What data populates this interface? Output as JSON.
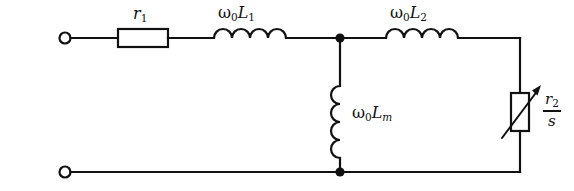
{
  "diagram": {
    "type": "electrical-schematic",
    "colors": {
      "wire": "#111111",
      "background": "#ffffff",
      "component_fill": "#ffffff"
    }
  },
  "labels": {
    "r1": {
      "symbol": "r",
      "subscript": "1"
    },
    "wL1": {
      "omega": "ω",
      "omega_sub": "0",
      "symbol": "L",
      "subscript": "1"
    },
    "wL2": {
      "omega": "ω",
      "omega_sub": "0",
      "symbol": "L",
      "subscript": "2"
    },
    "wLm": {
      "omega": "ω",
      "omega_sub": "0",
      "symbol": "L",
      "subscript": "m"
    },
    "r2_over_s": {
      "numerator": "r",
      "numerator_sub": "2",
      "denominator": "s"
    }
  },
  "components": {
    "terminal_top": "input-terminal-top",
    "terminal_bottom": "input-terminal-bottom",
    "resistor_r1": "stator-resistance-r1",
    "inductor_l1": "stator-leakage-reactance",
    "inductor_lm": "magnetizing-reactance",
    "inductor_l2": "rotor-leakage-reactance",
    "variable_resistor": "rotor-resistance-over-slip",
    "node_top": "shunt-node-top",
    "node_bottom": "shunt-node-bottom"
  }
}
